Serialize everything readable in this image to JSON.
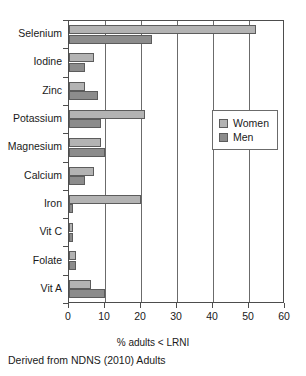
{
  "chart_data": {
    "type": "bar",
    "orientation": "horizontal",
    "title": "",
    "xlabel": "% adults < LRNI",
    "ylabel": "",
    "xlim": [
      0,
      60
    ],
    "xticks": [
      0,
      10,
      20,
      30,
      40,
      50,
      60
    ],
    "xtick_labels": [
      "0",
      "10",
      "20",
      "30",
      "40",
      "50",
      "60"
    ],
    "grid": "vertical",
    "legend_position": "right",
    "categories": [
      "Selenium",
      "Iodine",
      "Zinc",
      "Potassium",
      "Magnesium",
      "Calcium",
      "Iron",
      "Vit C",
      "Folate",
      "Vit A"
    ],
    "series": [
      {
        "name": "Women",
        "color": "#b3b3b3",
        "values": [
          52,
          7,
          4.5,
          21,
          9,
          7,
          20,
          1,
          2,
          6
        ]
      },
      {
        "name": "Men",
        "color": "#8c8c8c",
        "values": [
          23,
          4.5,
          8,
          9,
          10,
          4.5,
          1,
          1,
          2,
          10
        ]
      }
    ],
    "caption": "Derived from NDNS (2010) Adults"
  },
  "legend": {
    "entries": [
      {
        "label": "Women",
        "color": "#b3b3b3"
      },
      {
        "label": "Men",
        "color": "#8c8c8c"
      }
    ]
  },
  "colors": {
    "women": "#b3b3b3",
    "men": "#8c8c8c",
    "axis": "#4d4d4d",
    "gridline": "#6b6b6b",
    "text": "#1a1a1a",
    "background": "#ffffff"
  }
}
